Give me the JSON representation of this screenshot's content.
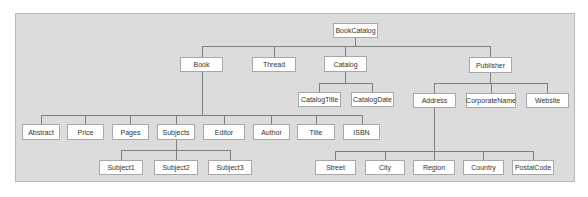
{
  "diagram": {
    "type": "tree",
    "root": "BookCatalog",
    "nodes": {
      "bookcatalog": "BookCatalog",
      "book": "Book",
      "thread": "Thread",
      "catalog": "Catalog",
      "publisher": "Publisher",
      "catalogtitle": "CatalogTitle",
      "catalogdate": "CatalogDate",
      "address": "Address",
      "corporatename": "CorporateName",
      "website": "Website",
      "abstract": "Abstract",
      "price": "Price",
      "pages": "Pages",
      "subjects": "Subjects",
      "editor": "Editor",
      "author": "Author",
      "title": "Title",
      "isbn": "ISBN",
      "subject1": "Subject1",
      "subject2": "Subject2",
      "subject3": "Subject3",
      "street": "Street",
      "city": "City",
      "region": "Region",
      "country": "Country",
      "postalcode": "PostalCode"
    },
    "edges": [
      [
        "BookCatalog",
        "Book"
      ],
      [
        "BookCatalog",
        "Thread"
      ],
      [
        "BookCatalog",
        "Catalog"
      ],
      [
        "BookCatalog",
        "Publisher"
      ],
      [
        "Book",
        "Abstract"
      ],
      [
        "Book",
        "Price"
      ],
      [
        "Book",
        "Pages"
      ],
      [
        "Book",
        "Subjects"
      ],
      [
        "Book",
        "Editor"
      ],
      [
        "Book",
        "Author"
      ],
      [
        "Book",
        "Title"
      ],
      [
        "Book",
        "ISBN"
      ],
      [
        "Subjects",
        "Subject1"
      ],
      [
        "Subjects",
        "Subject2"
      ],
      [
        "Subjects",
        "Subject3"
      ],
      [
        "Catalog",
        "CatalogTitle"
      ],
      [
        "Catalog",
        "CatalogDate"
      ],
      [
        "Publisher",
        "Address"
      ],
      [
        "Publisher",
        "CorporateName"
      ],
      [
        "Publisher",
        "Website"
      ],
      [
        "Address",
        "Street"
      ],
      [
        "Address",
        "City"
      ],
      [
        "Address",
        "Region"
      ],
      [
        "Address",
        "Country"
      ],
      [
        "Address",
        "PostalCode"
      ]
    ]
  }
}
